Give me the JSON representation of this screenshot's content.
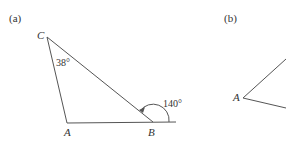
{
  "panel_a": {
    "label": "(a)",
    "vertex_c": "C",
    "vertex_a": "A",
    "vertex_b": "B",
    "angle_c": "38°",
    "exterior_angle_b": "140°"
  },
  "panel_b": {
    "label": "(b)",
    "vertex_a": "A"
  },
  "colors": {
    "line": "#555555",
    "text": "#333333"
  }
}
